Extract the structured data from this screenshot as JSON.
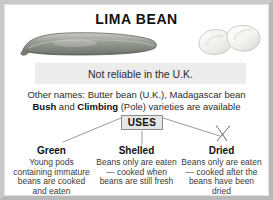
{
  "card": {
    "title": "LIMA BEAN",
    "banner": "Not reliable in the U.K.",
    "other_names_line1": "Other names: Butter bean (U.K.), Madagascar bean",
    "varieties": {
      "bush": "Bush",
      "and": " and ",
      "climbing": "Climbing",
      "tail": " (Pole) varieties are available"
    },
    "uses_label": "USES"
  },
  "icons": {
    "pod": "bean-pod-illustration",
    "beans": "shelled-beans-illustration",
    "dried": "drying-sparkle-icon"
  },
  "uses_columns": [
    {
      "title": "Green",
      "body": "Young pods containing immature beans are cooked and eaten"
    },
    {
      "title": "Shelled",
      "body": "Beans only are eaten — cooked when beans are still fresh"
    },
    {
      "title": "Dried",
      "body": "Beans only are eaten — cooked after the beans have been dried"
    }
  ],
  "colors": {
    "frame": "#c9c9c9",
    "banner_bg": "#ececec",
    "uses_bg": "#e6e6e6",
    "uses_border": "#8c8c8c",
    "text": "#2b2b2b",
    "heading": "#111111",
    "connector": "#8f8f8f"
  }
}
